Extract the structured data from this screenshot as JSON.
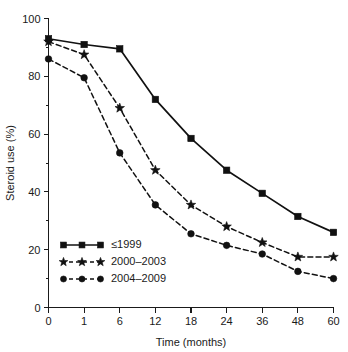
{
  "chart_data": {
    "type": "line",
    "title": "",
    "xlabel": "Time (months)",
    "ylabel": "Steroid use (%)",
    "categories": [
      "0",
      "1",
      "6",
      "12",
      "18",
      "24",
      "36",
      "48",
      "60"
    ],
    "x": [
      0,
      1,
      6,
      12,
      18,
      24,
      36,
      48,
      60
    ],
    "xtick_labels": [
      "0",
      "1",
      "6",
      "12",
      "18",
      "24",
      "36",
      "48",
      "60"
    ],
    "ytick_labels": [
      "0",
      "20",
      "40",
      "60",
      "80",
      "100"
    ],
    "yticks": [
      0,
      20,
      40,
      60,
      80,
      100
    ],
    "yminor_ticks": [
      10,
      30,
      50,
      70,
      90
    ],
    "ylim": [
      0,
      100
    ],
    "grid": false,
    "legend_position": "lower-left-inside",
    "axis_color": "#1a1a1a",
    "series": [
      {
        "name": "≤1999",
        "marker": "square",
        "linestyle": "solid",
        "color": "#111111",
        "values": [
          93,
          91,
          89.5,
          72,
          58.5,
          47.5,
          39.5,
          31.5,
          26
        ]
      },
      {
        "name": "2000–2003",
        "marker": "star",
        "linestyle": "dashed",
        "color": "#111111",
        "values": [
          92,
          87.5,
          69,
          47.5,
          35.5,
          28,
          22.5,
          17.5,
          17.5
        ]
      },
      {
        "name": "2004–2009",
        "marker": "circle",
        "linestyle": "dashed",
        "color": "#111111",
        "values": [
          86,
          79.5,
          53.5,
          35.5,
          25.5,
          21.5,
          18.5,
          12.5,
          10
        ]
      }
    ]
  },
  "legend": {
    "items": [
      {
        "label": "≤1999",
        "marker": "square",
        "linestyle": "solid"
      },
      {
        "label": "2000–2003",
        "marker": "star",
        "linestyle": "dashed"
      },
      {
        "label": "2004–2009",
        "marker": "circle",
        "linestyle": "dashed"
      }
    ]
  }
}
